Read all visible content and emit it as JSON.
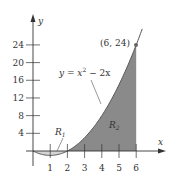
{
  "chart_data": {
    "type": "area",
    "title": "",
    "xlabel": "x",
    "ylabel": "y",
    "function": "y = x^2 - 2x",
    "xlim": [
      0,
      6
    ],
    "ylim": [
      0,
      24
    ],
    "x_ticks": [
      1,
      2,
      3,
      4,
      5,
      6
    ],
    "x_tick_labels": [
      "1",
      "2",
      "3",
      "4",
      "5",
      "6"
    ],
    "y_ticks": [
      4,
      8,
      12,
      16,
      20,
      24
    ],
    "y_tick_labels": [
      "4",
      "8",
      "12",
      "16",
      "20",
      "24"
    ],
    "series": [
      {
        "name": "y = x^2 - 2x",
        "x": [
          0,
          0.5,
          1,
          1.5,
          2,
          2.5,
          3,
          3.5,
          4,
          4.5,
          5,
          5.5,
          6
        ],
        "values": [
          0,
          -0.75,
          -1,
          -0.75,
          0,
          1.25,
          3,
          5.25,
          8,
          11.25,
          15,
          19.25,
          24
        ]
      }
    ],
    "regions": [
      {
        "name": "R1",
        "x_range": [
          0,
          2
        ],
        "shade": "light"
      },
      {
        "name": "R2",
        "x_range": [
          2,
          6
        ],
        "shade": "dark"
      }
    ],
    "annotations": [
      {
        "text": "(6, 24)",
        "x": 6,
        "y": 24,
        "marker": "point"
      },
      {
        "text": "y = x² − 2x",
        "pointer_to": "curve"
      },
      {
        "text": "R1",
        "pointer_to": "region R1"
      },
      {
        "text": "R2"
      }
    ],
    "grid": false,
    "legend": "none"
  },
  "labels": {
    "y_axis": "y",
    "x_axis": "x",
    "point": "(6, 24)",
    "equation_y": "y = x",
    "equation_exp": "2",
    "equation_tail": " − 2x",
    "r1_main": "R",
    "r1_sub": "1",
    "r2_main": "R",
    "r2_sub": "2"
  },
  "colors": {
    "r1_fill": "#d4d4d4",
    "r2_fill": "#8a8a8a",
    "curve": "#555555",
    "axis": "#333333"
  }
}
